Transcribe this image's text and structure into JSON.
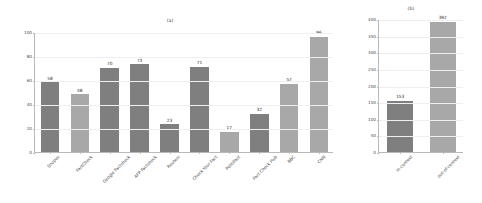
{
  "figure": {
    "background": "#ffffff",
    "width": 482,
    "height": 203
  },
  "panels": [
    {
      "id": "panel-a",
      "title": "(a)"
    },
    {
      "id": "panel-b",
      "title": "(b)"
    }
  ],
  "colors": {
    "bar_dark": "#7f7f7f",
    "bar_light": "#a8a8a8",
    "axis": "#b9b9b9",
    "grid": "#efeff2",
    "text": "#3d3d3d"
  },
  "chart_data": [
    {
      "type": "bar",
      "id": "panel-a",
      "title": "(a)",
      "xlabel": "",
      "ylabel": "",
      "ylim": [
        0,
        100
      ],
      "yticks": [
        0,
        20,
        40,
        60,
        80,
        100
      ],
      "grid": true,
      "legend": "none",
      "categories": [
        "Snopes",
        "FactCheck",
        "Google Factcheck",
        "AFP Factcheck",
        "Reuters",
        "Check Your Fact",
        "PolitiFact",
        "Fact Check Hub",
        "BBC",
        "CNN"
      ],
      "values": [
        58,
        48,
        70,
        73,
        23,
        71,
        17,
        32,
        57,
        96
      ],
      "bar_colors": [
        "#7f7f7f",
        "#a8a8a8",
        "#7f7f7f",
        "#7f7f7f",
        "#7f7f7f",
        "#7f7f7f",
        "#a8a8a8",
        "#7f7f7f",
        "#a8a8a8",
        "#a8a8a8"
      ]
    },
    {
      "type": "bar",
      "id": "panel-b",
      "title": "(b)",
      "xlabel": "",
      "ylabel": "",
      "ylim": [
        0,
        400
      ],
      "yticks": [
        0,
        50,
        100,
        150,
        200,
        250,
        300,
        350,
        400
      ],
      "grid": true,
      "legend": "none",
      "categories": [
        "in-context",
        "out-of-context"
      ],
      "values": [
        153,
        392
      ],
      "bar_colors": [
        "#7f7f7f",
        "#a8a8a8"
      ]
    }
  ]
}
